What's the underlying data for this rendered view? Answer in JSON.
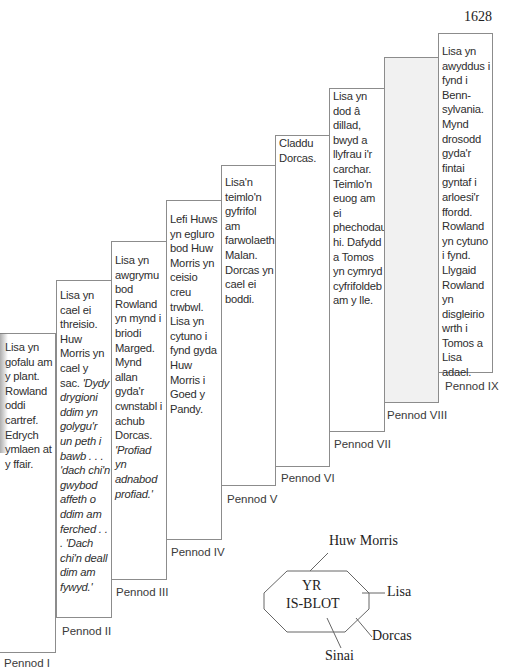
{
  "year": "1628",
  "chapters": [
    {
      "label": "Pennod I",
      "text": "Lisa yn gofalu am y plant. Rowland oddi cartref. Edrych ymlaen at y ffair.",
      "italic": ""
    },
    {
      "label": "Pennod II",
      "text": "Lisa yn cael ei threisio. Huw Morris yn cael y sac.",
      "italic": "'Dydy drygioni ddim yn golygu'r un peth i bawb . . . 'dach chi'n gwybod affeth o ddim am ferched . . . 'Dach chi'n deall dim am fywyd.'"
    },
    {
      "label": "Pennod III",
      "text": "Lisa yn awgrymu bod Rowland yn mynd i briodi Marged. Mynd allan gyda'r cwnstabl i achub Dorcas.",
      "italic": "'Profiad yn adnabod profiad.'"
    },
    {
      "label": "Pennod IV",
      "text": "Lefi Huws yn egluro bod Huw Morris yn ceisio creu trwbwl. Lisa yn cytuno i fynd gyda Huw Morris i Goed y Pandy.",
      "italic": ""
    },
    {
      "label": "Pennod V",
      "text": "Lisa'n teimlo'n gyfrifol am farwolaeth Malan. Dorcas yn cael ei boddi.",
      "italic": ""
    },
    {
      "label": "Pennod VI",
      "text": "Claddu Dorcas.",
      "italic": ""
    },
    {
      "label": "Pennod VII",
      "text": "Lisa yn dod â dillad, bwyd a llyfrau i'r carchar. Teimlo'n euog am ei phechodau hi. Dafydd a Tomos yn cymryd cyfrifoldeb am y lle.",
      "italic": ""
    },
    {
      "label": "Pennod VIII",
      "text": "",
      "italic": ""
    },
    {
      "label": "Pennod IX",
      "text": "Lisa yn awyddus i fynd i Benn-sylvania. Mynd drosodd gyda'r fintai gyntaf i arloesi'r ffordd. Rowland yn cytuno i fynd. Llygaid Rowland yn disgleirio wrth i Tomos a Lisa adael.",
      "italic": ""
    }
  ],
  "isblot": {
    "title_line1": "YR",
    "title_line2": "IS-BLOT",
    "spokes": [
      "Huw Morris",
      "Lisa",
      "Dorcas",
      "Sinai"
    ]
  }
}
